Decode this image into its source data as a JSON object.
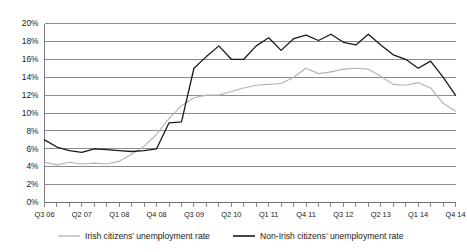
{
  "chart_data": {
    "type": "line",
    "title": "",
    "xlabel": "",
    "ylabel": "",
    "ylim": [
      0,
      20
    ],
    "ytick_labels": [
      "0%",
      "2%",
      "4%",
      "6%",
      "8%",
      "10%",
      "12%",
      "14%",
      "16%",
      "18%",
      "20%"
    ],
    "ytick_values": [
      0,
      2,
      4,
      6,
      8,
      10,
      12,
      14,
      16,
      18,
      20
    ],
    "grid": true,
    "legend_position": "bottom",
    "x": [
      "Q3 06",
      "Q4 06",
      "Q1 07",
      "Q2 07",
      "Q3 07",
      "Q4 07",
      "Q1 08",
      "Q2 08",
      "Q3 08",
      "Q4 08",
      "Q1 09",
      "Q2 09",
      "Q3 09",
      "Q4 09",
      "Q1 10",
      "Q2 10",
      "Q3 10",
      "Q4 10",
      "Q1 11",
      "Q2 11",
      "Q3 11",
      "Q4 11",
      "Q1 12",
      "Q2 12",
      "Q3 12",
      "Q4 12",
      "Q1 13",
      "Q2 13",
      "Q3 13",
      "Q4 13",
      "Q1 14",
      "Q2 14",
      "Q3 14",
      "Q4 14"
    ],
    "xtick_labels_shown": [
      "Q3 06",
      "Q2 07",
      "Q1 08",
      "Q4 08",
      "Q3 09",
      "Q2 10",
      "Q1 11",
      "Q4 11",
      "Q3 12",
      "Q2 13",
      "Q1 14",
      "Q4 14"
    ],
    "xtick_label_interval": 3,
    "series": [
      {
        "name": "Irish citizens' unemployment rate",
        "color": "#b3b3b3",
        "values": [
          4.5,
          4.2,
          4.5,
          4.3,
          4.4,
          4.3,
          4.6,
          5.4,
          6.3,
          7.6,
          9.4,
          10.8,
          11.7,
          12.0,
          12.0,
          12.4,
          12.8,
          13.1,
          13.2,
          13.3,
          14.0,
          15.0,
          14.4,
          14.6,
          14.9,
          15.0,
          14.9,
          14.1,
          13.2,
          13.1,
          13.4,
          12.8,
          11.1,
          10.2
        ]
      },
      {
        "name": "Non-Irish citizens' unemployment rate",
        "color": "#1a1a1a",
        "values": [
          7.0,
          6.2,
          5.8,
          5.6,
          6.0,
          5.9,
          5.8,
          5.7,
          5.8,
          6.0,
          8.9,
          9.0,
          15.0,
          16.3,
          17.5,
          16.0,
          16.0,
          17.5,
          18.4,
          17.0,
          18.3,
          18.7,
          18.1,
          18.8,
          17.9,
          17.6,
          18.8,
          17.6,
          16.5,
          16.0,
          15.0,
          15.8,
          14.0,
          12.0
        ]
      }
    ]
  },
  "legend": {
    "items": [
      {
        "label": "Irish citizens' unemployment rate",
        "color": "#b3b3b3"
      },
      {
        "label": "Non-Irish citizens' unemployment rate",
        "color": "#1a1a1a"
      }
    ]
  }
}
